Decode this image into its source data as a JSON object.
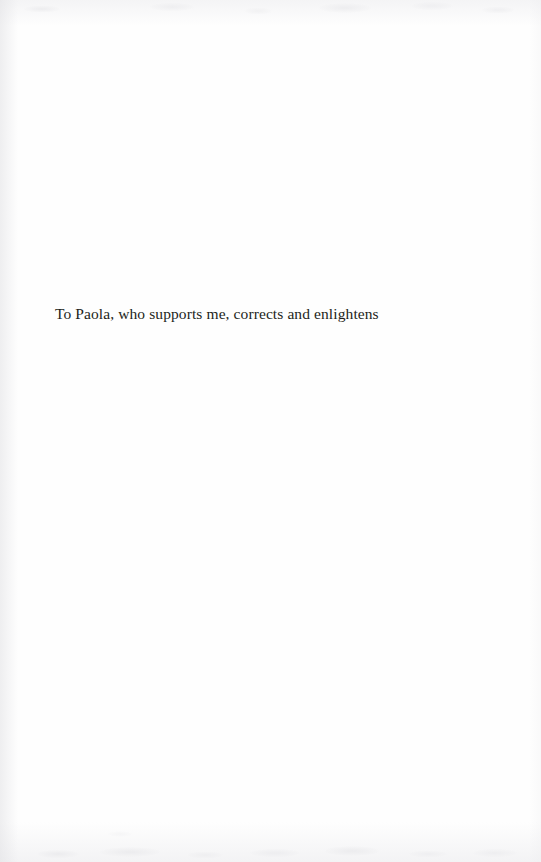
{
  "page": {
    "kind": "book-dedication-page",
    "background_color": "#fefefe",
    "text_color": "#231f20",
    "width": 541,
    "height": 862
  },
  "dedication": {
    "text": "To Paola, who supports me, corrects and enlightens"
  }
}
